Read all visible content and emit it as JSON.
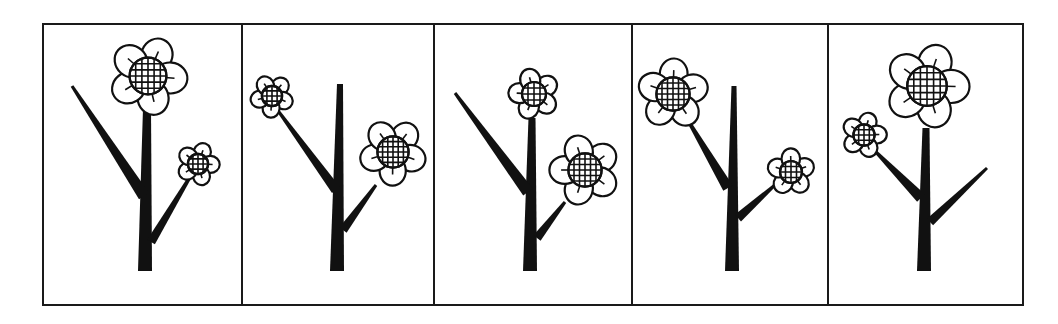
{
  "figure": {
    "title": "",
    "background_color": "#ffffff",
    "ink_color": "#111111",
    "outer_frame": {
      "x": 43,
      "y": 24,
      "width": 980,
      "height": 281
    },
    "dividers_x": [
      242,
      434,
      632,
      828
    ]
  },
  "panels": [
    {
      "index": 1,
      "x0": 43,
      "x1": 242,
      "stem": {
        "bottom": [
          145,
          271
        ],
        "top": [
          147,
          108
        ],
        "width_bottom": 14,
        "width_top": 8
      },
      "branches": [
        {
          "from": [
            144,
            196
          ],
          "to": [
            72,
            86
          ],
          "width": 12,
          "side": "left",
          "flower": null
        },
        {
          "from": [
            151,
            242
          ],
          "to": [
            193,
            172
          ],
          "width": 9,
          "side": "right",
          "flower": "small"
        }
      ],
      "flowers": [
        {
          "role": "top",
          "size": "large",
          "cx": 148,
          "cy": 76,
          "r": 40
        },
        {
          "role": "right-branch",
          "size": "small",
          "cx": 198,
          "cy": 164,
          "r": 22
        }
      ]
    },
    {
      "index": 2,
      "x0": 242,
      "x1": 434,
      "stem": {
        "bottom": [
          337,
          271
        ],
        "top": [
          340,
          84
        ],
        "width_bottom": 14,
        "width_top": 6
      },
      "branches": [
        {
          "from": [
            336,
            190
          ],
          "to": [
            279,
            112
          ],
          "width": 10,
          "side": "left",
          "flower": "small"
        },
        {
          "from": [
            343,
            230
          ],
          "to": [
            376,
            185
          ],
          "width": 9,
          "side": "right",
          "flower": "large"
        }
      ],
      "flowers": [
        {
          "role": "left-branch",
          "size": "small",
          "cx": 272,
          "cy": 96,
          "r": 22
        },
        {
          "role": "right-branch",
          "size": "large",
          "cx": 393,
          "cy": 152,
          "r": 34
        }
      ]
    },
    {
      "index": 3,
      "x0": 434,
      "x1": 632,
      "stem": {
        "bottom": [
          530,
          271
        ],
        "top": [
          532,
          118
        ],
        "width_bottom": 14,
        "width_top": 7
      },
      "branches": [
        {
          "from": [
            528,
            192
          ],
          "to": [
            455,
            93
          ],
          "width": 12,
          "side": "left",
          "flower": null
        },
        {
          "from": [
            537,
            238
          ],
          "to": [
            565,
            202
          ],
          "width": 9,
          "side": "right",
          "flower": "large"
        }
      ],
      "flowers": [
        {
          "role": "top",
          "size": "small",
          "cx": 534,
          "cy": 94,
          "r": 26
        },
        {
          "role": "right-branch",
          "size": "large",
          "cx": 585,
          "cy": 170,
          "r": 36
        }
      ]
    },
    {
      "index": 4,
      "x0": 632,
      "x1": 828,
      "stem": {
        "bottom": [
          732,
          271
        ],
        "top": [
          734,
          86
        ],
        "width_bottom": 14,
        "width_top": 5
      },
      "branches": [
        {
          "from": [
            728,
            188
          ],
          "to": [
            686,
            117
          ],
          "width": 11,
          "side": "left",
          "flower": "large"
        },
        {
          "from": [
            738,
            218
          ],
          "to": [
            776,
            184
          ],
          "width": 9,
          "side": "right",
          "flower": "small"
        }
      ],
      "flowers": [
        {
          "role": "left-branch",
          "size": "large",
          "cx": 673,
          "cy": 94,
          "r": 36
        },
        {
          "role": "right-branch",
          "size": "small",
          "cx": 791,
          "cy": 172,
          "r": 24
        }
      ]
    },
    {
      "index": 5,
      "x0": 828,
      "x1": 1023,
      "stem": {
        "bottom": [
          924,
          271
        ],
        "top": [
          926,
          128
        ],
        "width_bottom": 14,
        "width_top": 7
      },
      "branches": [
        {
          "from": [
            921,
            198
          ],
          "to": [
            874,
            150
          ],
          "width": 11,
          "side": "left",
          "flower": "small"
        },
        {
          "from": [
            930,
            222
          ],
          "to": [
            987,
            168
          ],
          "width": 9,
          "side": "right",
          "flower": null
        }
      ],
      "flowers": [
        {
          "role": "top",
          "size": "large",
          "cx": 927,
          "cy": 86,
          "r": 43
        },
        {
          "role": "left-branch",
          "size": "small",
          "cx": 864,
          "cy": 135,
          "r": 23
        }
      ]
    }
  ]
}
